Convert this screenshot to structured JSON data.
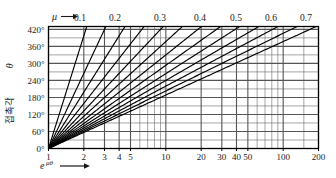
{
  "chart_data": {
    "type": "line",
    "title": "",
    "subtitle": "",
    "xlabel": "e^{μθ}",
    "xlabel_symbol": "e",
    "xlabel_exponent": "μθ",
    "ylabel": "접촉각 θ",
    "ylabel_korean": "접촉각",
    "ylabel_symbol": "θ",
    "top_axis_label": "μ",
    "xscale": "log",
    "yscale": "linear",
    "xlim": [
      1,
      200
    ],
    "ylim": [
      0,
      430
    ],
    "grid": true,
    "legend_position": "top",
    "x_ticks": [
      {
        "value": 1,
        "label": "1"
      },
      {
        "value": 2,
        "label": "2"
      },
      {
        "value": 3,
        "label": "3"
      },
      {
        "value": 4,
        "label": "4"
      },
      {
        "value": 5,
        "label": "5"
      },
      {
        "value": 10,
        "label": "10"
      },
      {
        "value": 20,
        "label": "20"
      },
      {
        "value": 30,
        "label": "30"
      },
      {
        "value": 40,
        "label": "40"
      },
      {
        "value": 50,
        "label": "50"
      },
      {
        "value": 100,
        "label": "100"
      },
      {
        "value": 200,
        "label": "200"
      }
    ],
    "x_minor_ticks": [
      6,
      7,
      8,
      9,
      60,
      70,
      80,
      90,
      150
    ],
    "y_ticks": [
      {
        "value": 0,
        "label": "0°"
      },
      {
        "value": 60,
        "label": "60°"
      },
      {
        "value": 120,
        "label": "120°"
      },
      {
        "value": 180,
        "label": "180°"
      },
      {
        "value": 240,
        "label": "240°"
      },
      {
        "value": 300,
        "label": "300°"
      },
      {
        "value": 360,
        "label": "360°"
      },
      {
        "value": 420,
        "label": "420°"
      }
    ],
    "y_minor_ticks": [
      30,
      90,
      150,
      210,
      270,
      330,
      390
    ],
    "relation": "theta_deg = ln(x) * (180/pi) / mu",
    "series": [
      {
        "name": "0.10",
        "mu": 0.1,
        "labeled": true,
        "label": "0.1"
      },
      {
        "name": "0.15",
        "mu": 0.15,
        "labeled": false,
        "label": ""
      },
      {
        "name": "0.20",
        "mu": 0.2,
        "labeled": true,
        "label": "0.2"
      },
      {
        "name": "0.25",
        "mu": 0.25,
        "labeled": false,
        "label": ""
      },
      {
        "name": "0.30",
        "mu": 0.3,
        "labeled": true,
        "label": "0.3"
      },
      {
        "name": "0.35",
        "mu": 0.35,
        "labeled": false,
        "label": ""
      },
      {
        "name": "0.40",
        "mu": 0.4,
        "labeled": true,
        "label": "0.4"
      },
      {
        "name": "0.45",
        "mu": 0.45,
        "labeled": false,
        "label": ""
      },
      {
        "name": "0.50",
        "mu": 0.5,
        "labeled": true,
        "label": "0.5"
      },
      {
        "name": "0.55",
        "mu": 0.55,
        "labeled": false,
        "label": ""
      },
      {
        "name": "0.60",
        "mu": 0.6,
        "labeled": true,
        "label": "0.6"
      },
      {
        "name": "0.65",
        "mu": 0.65,
        "labeled": false,
        "label": ""
      },
      {
        "name": "0.70",
        "mu": 0.7,
        "labeled": true,
        "label": "0.7"
      }
    ],
    "mu_labels": [
      {
        "text": "0.1",
        "x": 80
      },
      {
        "text": "0.2",
        "x": 115
      },
      {
        "text": "0.3",
        "x": 160
      },
      {
        "text": "0.4",
        "x": 200
      },
      {
        "text": "0.5",
        "x": 236
      },
      {
        "text": "0.6",
        "x": 271
      },
      {
        "text": "0.7",
        "x": 306
      }
    ],
    "colors": {
      "background": "#ffffff",
      "grid": "#555555",
      "frame": "#000000",
      "curve": "#000000",
      "text": "#1a1a1a"
    }
  }
}
